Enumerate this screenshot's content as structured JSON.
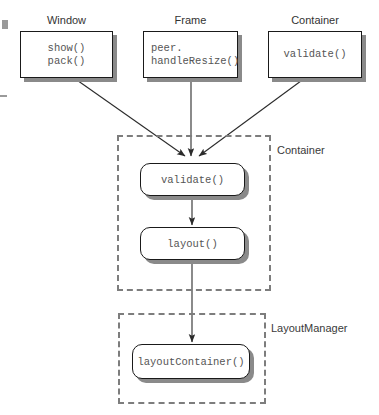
{
  "diagram": {
    "colors": {
      "box_fill": "#ffffff",
      "box_border": "#1a1a1a",
      "shadow": "#8a8a8a",
      "dashed_border": "#7d7d7d",
      "code_text": "#555555",
      "label_text": "#333333",
      "arrow": "#2b2b2b"
    },
    "classes": [
      {
        "name": "window",
        "title": "Window",
        "methods": "show()\npack()",
        "align": "center"
      },
      {
        "name": "frame",
        "title": "Frame",
        "methods": "peer.\nhandleResize()",
        "align": "left"
      },
      {
        "name": "container",
        "title": "Container",
        "methods": "validate()",
        "align": "center"
      }
    ],
    "groups": [
      {
        "name": "container-group",
        "label": "Container",
        "methods": [
          {
            "name": "validate",
            "label": "validate()"
          },
          {
            "name": "layout",
            "label": "layout()"
          }
        ]
      },
      {
        "name": "layoutmanager-group",
        "label": "LayoutManager",
        "methods": [
          {
            "name": "layout-container",
            "label": "layoutContainer()"
          }
        ]
      }
    ],
    "connections": [
      {
        "name": "window-to-validate",
        "from": "Window",
        "to": "validate()"
      },
      {
        "name": "frame-to-validate",
        "from": "Frame",
        "to": "validate()"
      },
      {
        "name": "container-to-validate",
        "from": "Container",
        "to": "validate()"
      },
      {
        "name": "validate-to-layout",
        "from": "validate()",
        "to": "layout()"
      },
      {
        "name": "layout-to-layoutcontainer",
        "from": "layout()",
        "to": "layoutContainer()"
      }
    ]
  }
}
